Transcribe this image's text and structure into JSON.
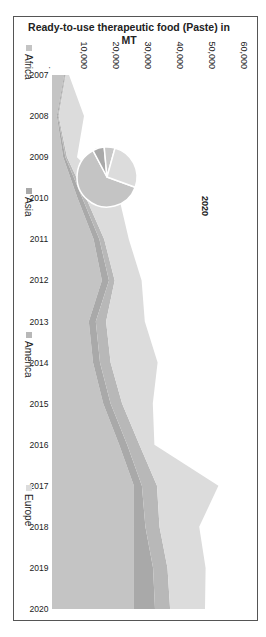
{
  "chart_data": {
    "type": "area",
    "stacked": true,
    "title": "",
    "xlabel": "",
    "ylabel": "Ready-to-use therapeutic food (Paste) in MT",
    "ylim": [
      0,
      60000
    ],
    "yticks": [
      "10,000",
      "20,000",
      "30,000",
      "40,000",
      "50,000",
      "60,000"
    ],
    "ytick_values": [
      10000,
      20000,
      30000,
      40000,
      50000,
      60000
    ],
    "grid": false,
    "legend_position": "bottom",
    "orientation_note": "figure rotated 90 degrees clockwise in screenshot",
    "categories": [
      "2007",
      "2008",
      "2009",
      "2010",
      "2011",
      "2012",
      "2013",
      "2014",
      "2015",
      "2016",
      "2017",
      "2018",
      "2019",
      "2020"
    ],
    "series": [
      {
        "name": "Africa",
        "color": "#c4c4c4",
        "values": [
          3800,
          1500,
          3500,
          8000,
          13000,
          15600,
          11500,
          12800,
          16000,
          21000,
          25600,
          25600,
          25600,
          25600
        ]
      },
      {
        "name": "Asia",
        "color": "#a9a9a9",
        "values": [
          300,
          300,
          700,
          1500,
          1800,
          2200,
          2200,
          2200,
          2300,
          2500,
          2500,
          3600,
          6000,
          6600
        ]
      },
      {
        "name": "America",
        "color": "#b8b8b8",
        "values": [
          200,
          300,
          500,
          1200,
          1500,
          1800,
          3200,
          3300,
          3600,
          3800,
          4700,
          4400,
          4500,
          4700
        ]
      },
      {
        "name": "Europe",
        "color": "#dcdcdc",
        "values": [
          1000,
          7900,
          3100,
          10300,
          7700,
          8400,
          12100,
          14700,
          9600,
          4700,
          19200,
          12400,
          11900,
          10900
        ]
      }
    ],
    "inset_pie": {
      "title": "2020",
      "slices": [
        {
          "name": "Africa",
          "value": 25600,
          "color": "#c4c4c4"
        },
        {
          "name": "Asia",
          "value": 2600,
          "color": "#a9a9a9"
        },
        {
          "name": "America",
          "value": 2400,
          "color": "#c8c8c8"
        },
        {
          "name": "Europe",
          "value": 10900,
          "color": "#dcdcdc"
        }
      ]
    }
  },
  "labels": {
    "ylabel_line1": "Ready-to-use therapeutic food (Paste) in",
    "ylabel_line2": "MT",
    "pie_title": "2020",
    "legend": [
      "Africa",
      "Asia",
      "America",
      "Europe"
    ]
  }
}
